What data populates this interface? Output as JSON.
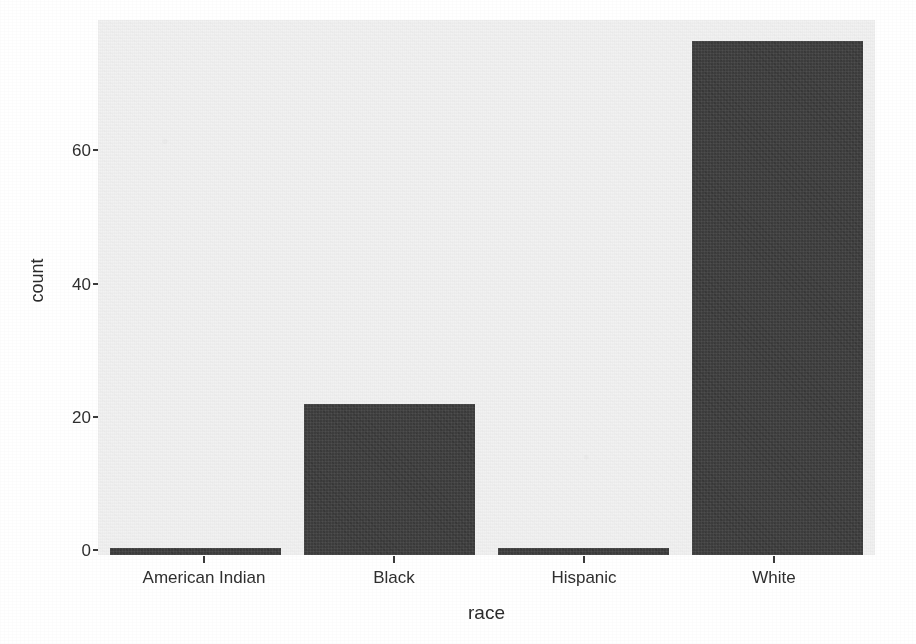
{
  "chart_data": {
    "type": "bar",
    "title": "",
    "subtitle": "",
    "xlabel": "race",
    "ylabel": "count",
    "categories": [
      "American Indian",
      "Black",
      "Hispanic",
      "White"
    ],
    "values": [
      1,
      22,
      1,
      75
    ],
    "ylim": [
      0,
      78
    ],
    "y_ticks": [
      0,
      20,
      40,
      60
    ],
    "y_tick_labels": [
      "0",
      "20",
      "40",
      "60"
    ],
    "x_tick_labels": [
      "American Indian",
      "Black",
      "Hispanic",
      "White"
    ],
    "grid": false,
    "legend": "none",
    "bar_color": "#3c3c3c",
    "panel_background": "#f2f2f2",
    "figure_background": "#ffffff"
  },
  "axes": {
    "y_axis_title": "count",
    "x_axis_title": "race"
  }
}
